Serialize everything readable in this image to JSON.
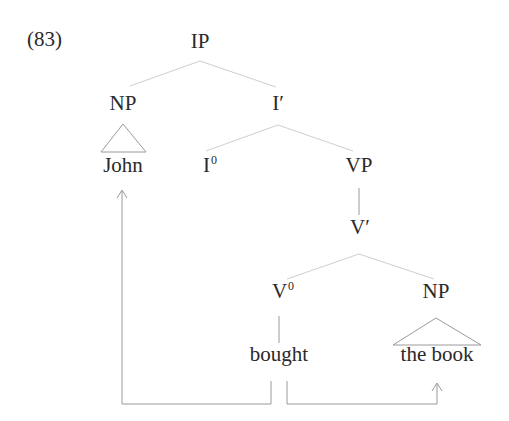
{
  "example_number": "(83)",
  "tree": {
    "nodes": {
      "ip": "IP",
      "np_subject": "NP",
      "i_bar": "I′",
      "john": "John",
      "i_zero_base": "I",
      "i_zero_sup": "0",
      "vp": "VP",
      "v_bar": "V′",
      "v_zero_base": "V",
      "v_zero_sup": "0",
      "np_object": "NP",
      "bought": "bought",
      "the_book": "the book"
    },
    "structure": "[IP [NP John] [I′ [I0] [VP [V′ [V0 bought] [NP the book]]]]]",
    "arrows": [
      {
        "from": "bought",
        "to": "John",
        "description": "theta-role assignment / relation arrow from verb to subject"
      },
      {
        "from": "bought",
        "to": "the book",
        "description": "relation arrow from verb to object"
      }
    ]
  },
  "colors": {
    "text": "#2a2a2a",
    "branch_line": "#c8c8c8",
    "arrow_line": "#9a9a9a",
    "background": "#ffffff"
  }
}
